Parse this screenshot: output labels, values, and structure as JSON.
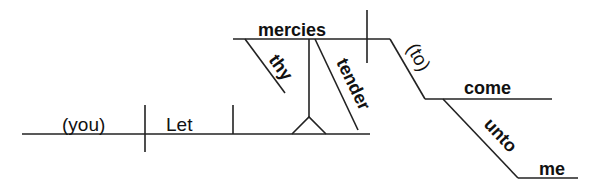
{
  "diagram": {
    "type": "sentence-diagram",
    "sentence": "Let thy tender mercies come unto me",
    "words": {
      "subject": "(you)",
      "verb": "Let",
      "object_of_let": "mercies",
      "modifier_1": "thy",
      "modifier_2": "tender",
      "infinitive_marker": "(to)",
      "infinitive_verb": "come",
      "preposition": "unto",
      "prep_object": "me"
    },
    "colors": {
      "line": "#222222",
      "text": "#111111",
      "background": "#ffffff"
    }
  }
}
